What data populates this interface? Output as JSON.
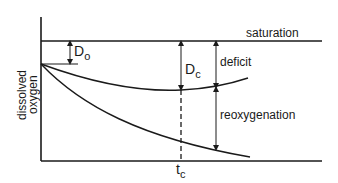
{
  "diagram": {
    "y_axis_label_line1": "dissolved",
    "y_axis_label_line2": "oxygen",
    "labels": {
      "saturation": "saturation",
      "deficit": "deficit",
      "reoxygenation": "reoxygenation",
      "d0_main": "D",
      "d0_sub": "o",
      "dc_main": "D",
      "dc_sub": "c",
      "tc_main": "t",
      "tc_sub": "c"
    },
    "colors": {
      "ink": "#1a1a1a",
      "background": "#ffffff"
    }
  }
}
